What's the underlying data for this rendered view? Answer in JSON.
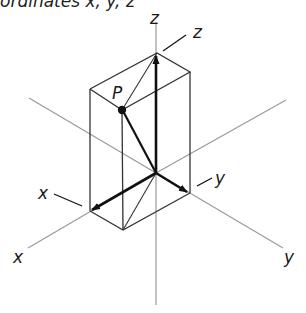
{
  "caption": "ordinates x, y, z",
  "labels": {
    "z_axis": "z",
    "z_vector": "z",
    "y_vector": "y",
    "y_axis": "y",
    "x_vector": "x",
    "x_axis": "x",
    "point": "P"
  },
  "colors": {
    "axis_line": "#9a9a9a",
    "box_edge": "#333333",
    "vector": "#111111",
    "background": "#ffffff"
  },
  "geometry": {
    "origin": [
      156,
      173
    ],
    "point_P": [
      122,
      110
    ],
    "box_top_vertex": [
      157,
      53
    ],
    "box_top_left": [
      90,
      89
    ],
    "box_top_right": [
      190,
      72
    ],
    "box_bottom_left": [
      90,
      211
    ],
    "box_bottom_front": [
      123,
      230
    ],
    "box_bottom_right": [
      190,
      193
    ]
  }
}
